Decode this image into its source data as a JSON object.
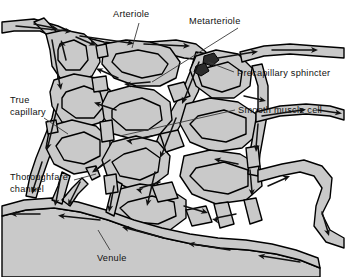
{
  "figure": {
    "name": "capillary-bed-diagram",
    "background_color": "#ffffff",
    "vessel_fill_color": "#c9c9c9",
    "vessel_outline_color": "#000000",
    "lumen_color": "#ffffff",
    "arrow_color": "#111111",
    "label_color": "#111111",
    "leader_color": "#3a3a3a"
  },
  "labels": {
    "arteriole": "Arteriole",
    "metarteriole": "Metarteriole",
    "precapillary_sphincter": "Precapillary sphincter",
    "true_capillary_line1": "True",
    "true_capillary_line2": "capillary",
    "smooth_muscle_cell": "Smooth muscle cell",
    "thoroughfare_line1": "Thoroughfare",
    "thoroughfare_line2": "channel",
    "venule": "Venule"
  }
}
